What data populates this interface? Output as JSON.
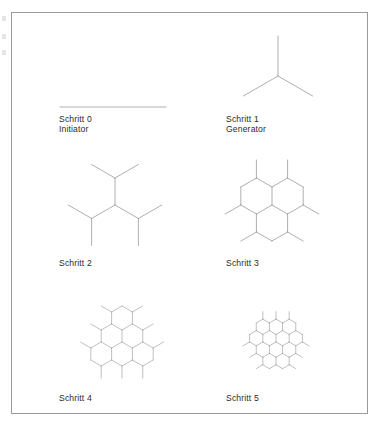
{
  "figure": {
    "language": "de",
    "border_color": "#9a9a9a",
    "line_color": "#8c8c8c",
    "background_color": "#ffffff",
    "text_color": "#2b2b2b",
    "width": 388,
    "height": 432
  },
  "panels": [
    {
      "id": "schritt-0",
      "step_label": "Schritt 0",
      "role_label": "Initiator",
      "shape": "single-segment",
      "label_x": 59,
      "label_y": 114,
      "origin_x": 113,
      "origin_y": 107,
      "generations": 0,
      "seg_len": 53
    },
    {
      "id": "schritt-1",
      "step_label": "Schritt 1",
      "role_label": "Generator",
      "shape": "y-branch",
      "label_x": 226,
      "label_y": 114,
      "origin_x": 278,
      "origin_y": 76,
      "generations": 1,
      "seg_len": 40
    },
    {
      "id": "schritt-2",
      "step_label": "Schritt 2",
      "role_label": "",
      "shape": "dendrimer",
      "label_x": 59,
      "label_y": 258,
      "origin_x": 115,
      "origin_y": 205,
      "generations": 2,
      "seg_len": 27
    },
    {
      "id": "schritt-3",
      "step_label": "Schritt 3",
      "role_label": "",
      "shape": "dendrimer",
      "label_x": 226,
      "label_y": 258,
      "origin_x": 272,
      "origin_y": 205,
      "generations": 3,
      "seg_len": 18
    },
    {
      "id": "schritt-4",
      "step_label": "Schritt 4",
      "role_label": "",
      "shape": "dendrimer",
      "label_x": 59,
      "label_y": 393,
      "origin_x": 122,
      "origin_y": 342,
      "generations": 4,
      "seg_len": 12
    },
    {
      "id": "schritt-5",
      "step_label": "Schritt 5",
      "role_label": "",
      "shape": "dendrimer",
      "label_x": 226,
      "label_y": 393,
      "origin_x": 276,
      "origin_y": 342,
      "generations": 5,
      "seg_len": 7.6
    }
  ],
  "scan_marks": [
    {
      "y": 16
    },
    {
      "y": 34
    },
    {
      "y": 50
    }
  ]
}
